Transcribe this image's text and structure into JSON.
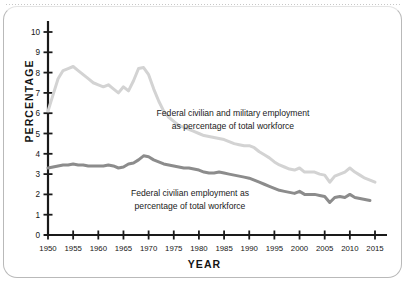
{
  "chart_data": {
    "type": "line",
    "title": "",
    "subtitle": "",
    "xlabel": "YEAR",
    "ylabel": "PERCENTAGE",
    "xlim": [
      1950,
      2015
    ],
    "ylim": [
      0,
      10
    ],
    "grid": false,
    "legend_position": "inline-annotations",
    "xticks": [
      1950,
      1955,
      1960,
      1965,
      1970,
      1975,
      1980,
      1985,
      1990,
      1995,
      2000,
      2005,
      2010,
      2015
    ],
    "yticks": [
      0,
      1,
      2,
      3,
      4,
      5,
      6,
      7,
      8,
      9,
      10
    ],
    "annotations": [
      {
        "name": "total-series-annotation",
        "line1": "Federal civilian and military employment",
        "line2": "as percentage of total workforce"
      },
      {
        "name": "civilian-series-annotation",
        "line1": "Federal civilian employment as",
        "line2": "percentage of total workforce"
      }
    ],
    "colors": {
      "total_series": "#d3d3d3",
      "civilian_series": "#8c8c8c",
      "axis": "#1a1a1a",
      "frame": "#b9b9b9",
      "background": "#ffffff"
    },
    "series": [
      {
        "name": "Federal civilian and military employment as percentage of total workforce",
        "color": "#d3d3d3",
        "x": [
          1950,
          1951,
          1952,
          1953,
          1954,
          1955,
          1956,
          1957,
          1958,
          1959,
          1960,
          1961,
          1962,
          1963,
          1964,
          1965,
          1966,
          1967,
          1968,
          1969,
          1970,
          1971,
          1972,
          1973,
          1974,
          1975,
          1976,
          1977,
          1978,
          1979,
          1980,
          1981,
          1982,
          1983,
          1984,
          1985,
          1986,
          1987,
          1988,
          1989,
          1990,
          1991,
          1992,
          1993,
          1994,
          1995,
          1996,
          1997,
          1998,
          1999,
          2000,
          2001,
          2002,
          2003,
          2004,
          2005,
          2006,
          2007,
          2008,
          2009,
          2010,
          2011,
          2012,
          2013,
          2014,
          2015
        ],
        "values": [
          6.1,
          6.9,
          7.7,
          8.1,
          8.2,
          8.3,
          8.1,
          7.9,
          7.7,
          7.5,
          7.4,
          7.3,
          7.4,
          7.2,
          7.0,
          7.3,
          7.1,
          7.6,
          8.2,
          8.25,
          7.9,
          7.2,
          6.6,
          6.1,
          5.8,
          5.6,
          5.4,
          5.3,
          5.2,
          5.1,
          5.0,
          4.9,
          4.85,
          4.8,
          4.75,
          4.7,
          4.6,
          4.5,
          4.45,
          4.4,
          4.4,
          4.3,
          4.1,
          3.95,
          3.8,
          3.6,
          3.45,
          3.35,
          3.25,
          3.2,
          3.3,
          3.1,
          3.1,
          3.1,
          3.0,
          2.95,
          2.6,
          2.9,
          3.0,
          3.1,
          3.3,
          3.1,
          2.95,
          2.8,
          2.7,
          2.6
        ]
      },
      {
        "name": "Federal civilian employment as percentage of total workforce",
        "color": "#8c8c8c",
        "x": [
          1950,
          1951,
          1952,
          1953,
          1954,
          1955,
          1956,
          1957,
          1958,
          1959,
          1960,
          1961,
          1962,
          1963,
          1964,
          1965,
          1966,
          1967,
          1968,
          1969,
          1970,
          1971,
          1972,
          1973,
          1974,
          1975,
          1976,
          1977,
          1978,
          1979,
          1980,
          1981,
          1982,
          1983,
          1984,
          1985,
          1986,
          1987,
          1988,
          1989,
          1990,
          1991,
          1992,
          1993,
          1994,
          1995,
          1996,
          1997,
          1998,
          1999,
          2000,
          2001,
          2002,
          2003,
          2004,
          2005,
          2006,
          2007,
          2008,
          2009,
          2010,
          2011,
          2012,
          2013,
          2014
        ],
        "values": [
          3.3,
          3.35,
          3.4,
          3.45,
          3.45,
          3.5,
          3.45,
          3.45,
          3.4,
          3.4,
          3.4,
          3.4,
          3.45,
          3.4,
          3.3,
          3.35,
          3.5,
          3.55,
          3.7,
          3.9,
          3.85,
          3.7,
          3.6,
          3.5,
          3.45,
          3.4,
          3.35,
          3.3,
          3.3,
          3.25,
          3.2,
          3.1,
          3.05,
          3.05,
          3.1,
          3.05,
          3.0,
          2.95,
          2.9,
          2.85,
          2.8,
          2.7,
          2.6,
          2.5,
          2.4,
          2.3,
          2.2,
          2.15,
          2.1,
          2.05,
          2.15,
          2.0,
          2.0,
          2.0,
          1.95,
          1.9,
          1.6,
          1.85,
          1.9,
          1.85,
          2.0,
          1.85,
          1.8,
          1.75,
          1.7
        ]
      }
    ]
  }
}
